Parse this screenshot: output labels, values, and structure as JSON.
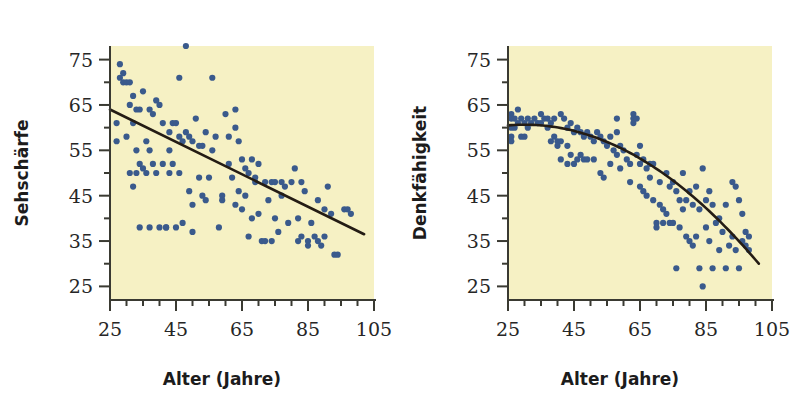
{
  "figure": {
    "background_color": "#ffffff",
    "plot_background_color": "#f6f1c4",
    "point_color": "#3a5a8c",
    "line_color": "#241c14",
    "axis_color": "#3a3a32",
    "text_color": "#262626"
  },
  "panels": [
    {
      "name": "sehschaerfe",
      "ylabel": "Sehschärfe",
      "xlabel": "Alter (Jahre)",
      "xticks": [
        "25",
        "45",
        "65",
        "85",
        "105"
      ],
      "yticks": [
        "75",
        "65",
        "55",
        "45",
        "35",
        "25"
      ]
    },
    {
      "name": "denkfaehigkeit",
      "ylabel": "Denkfähigkeit",
      "xlabel": "Alter (Jahre)",
      "xticks": [
        "25",
        "45",
        "65",
        "85",
        "105"
      ],
      "yticks": [
        "75",
        "65",
        "55",
        "45",
        "35",
        "25"
      ]
    }
  ],
  "chart_data": [
    {
      "type": "scatter",
      "title": "",
      "xlabel": "Alter (Jahre)",
      "ylabel": "Sehschärfe",
      "xlim": [
        25,
        105
      ],
      "ylim": [
        22,
        78
      ],
      "xticks": [
        25,
        45,
        65,
        85,
        105
      ],
      "yticks": [
        25,
        35,
        45,
        55,
        65,
        75
      ],
      "xminor_step": 5,
      "yminor_step": 5,
      "grid": false,
      "legend": "none",
      "points": [
        [
          27,
          61
        ],
        [
          27,
          57
        ],
        [
          28,
          74
        ],
        [
          28,
          71
        ],
        [
          29,
          72
        ],
        [
          29,
          70
        ],
        [
          30,
          70
        ],
        [
          30,
          58
        ],
        [
          31,
          70
        ],
        [
          31,
          65
        ],
        [
          31,
          50
        ],
        [
          32,
          67
        ],
        [
          32,
          61
        ],
        [
          32,
          47
        ],
        [
          33,
          64
        ],
        [
          33,
          55
        ],
        [
          33,
          50
        ],
        [
          34,
          64
        ],
        [
          34,
          52
        ],
        [
          34,
          38
        ],
        [
          35,
          68
        ],
        [
          35,
          51
        ],
        [
          36,
          57
        ],
        [
          36,
          50
        ],
        [
          37,
          64
        ],
        [
          37,
          55
        ],
        [
          37,
          38
        ],
        [
          38,
          63
        ],
        [
          38,
          52
        ],
        [
          39,
          66
        ],
        [
          39,
          50
        ],
        [
          40,
          65
        ],
        [
          40,
          38
        ],
        [
          41,
          61
        ],
        [
          41,
          52
        ],
        [
          42,
          38
        ],
        [
          42,
          38
        ],
        [
          43,
          59
        ],
        [
          43,
          55
        ],
        [
          43,
          50
        ],
        [
          44,
          61
        ],
        [
          44,
          52
        ],
        [
          45,
          61
        ],
        [
          45,
          38
        ],
        [
          46,
          71
        ],
        [
          46,
          58
        ],
        [
          46,
          50
        ],
        [
          47,
          57
        ],
        [
          47,
          39
        ],
        [
          48,
          78
        ],
        [
          48,
          59
        ],
        [
          49,
          58
        ],
        [
          49,
          46
        ],
        [
          50,
          57
        ],
        [
          50,
          43
        ],
        [
          50,
          37
        ],
        [
          51,
          62
        ],
        [
          52,
          56
        ],
        [
          52,
          49
        ],
        [
          53,
          56
        ],
        [
          53,
          45
        ],
        [
          54,
          59
        ],
        [
          54,
          44
        ],
        [
          55,
          49
        ],
        [
          56,
          71
        ],
        [
          56,
          55
        ],
        [
          57,
          58
        ],
        [
          58,
          38
        ],
        [
          59,
          45
        ],
        [
          59,
          44
        ],
        [
          60,
          63
        ],
        [
          61,
          58
        ],
        [
          61,
          52
        ],
        [
          62,
          49
        ],
        [
          63,
          64
        ],
        [
          63,
          60
        ],
        [
          63,
          43
        ],
        [
          64,
          57
        ],
        [
          64,
          46
        ],
        [
          65,
          53
        ],
        [
          65,
          42
        ],
        [
          66,
          51
        ],
        [
          66,
          45
        ],
        [
          67,
          50
        ],
        [
          67,
          36
        ],
        [
          68,
          53
        ],
        [
          68,
          40
        ],
        [
          69,
          49
        ],
        [
          69,
          48
        ],
        [
          70,
          52
        ],
        [
          70,
          41
        ],
        [
          71,
          35
        ],
        [
          72,
          35
        ],
        [
          72,
          48
        ],
        [
          73,
          44
        ],
        [
          74,
          35
        ],
        [
          74,
          48
        ],
        [
          75,
          48
        ],
        [
          75,
          40
        ],
        [
          76,
          37
        ],
        [
          77,
          48
        ],
        [
          77,
          45
        ],
        [
          78,
          47
        ],
        [
          79,
          39
        ],
        [
          80,
          48
        ],
        [
          81,
          51
        ],
        [
          82,
          40
        ],
        [
          82,
          35
        ],
        [
          83,
          36
        ],
        [
          83,
          48
        ],
        [
          84,
          46
        ],
        [
          85,
          35
        ],
        [
          85,
          34
        ],
        [
          86,
          39
        ],
        [
          87,
          36
        ],
        [
          88,
          44
        ],
        [
          88,
          35
        ],
        [
          89,
          34
        ],
        [
          90,
          42
        ],
        [
          90,
          36
        ],
        [
          91,
          47
        ],
        [
          92,
          41
        ],
        [
          93,
          32
        ],
        [
          94,
          32
        ],
        [
          96,
          42
        ],
        [
          97,
          42
        ],
        [
          98,
          41
        ]
      ],
      "fit": {
        "kind": "linear",
        "x_start": 25,
        "x_end": 102,
        "y_start": 64,
        "y_end": 36.5,
        "description": "negative linear trend line from about (25, 64) to (102, 36.5)"
      }
    },
    {
      "type": "scatter",
      "title": "",
      "xlabel": "Alter (Jahre)",
      "ylabel": "Denkfähigkeit",
      "xlim": [
        25,
        105
      ],
      "ylim": [
        22,
        78
      ],
      "xticks": [
        25,
        45,
        65,
        85,
        105
      ],
      "yticks": [
        25,
        35,
        45,
        55,
        65,
        75
      ],
      "xminor_step": 5,
      "yminor_step": 5,
      "grid": false,
      "legend": "none",
      "points": [
        [
          26,
          63
        ],
        [
          26,
          62
        ],
        [
          26,
          60
        ],
        [
          26,
          58
        ],
        [
          26,
          57
        ],
        [
          27,
          62
        ],
        [
          27,
          60
        ],
        [
          28,
          64
        ],
        [
          28,
          61
        ],
        [
          29,
          62
        ],
        [
          29,
          58
        ],
        [
          30,
          61
        ],
        [
          30,
          58
        ],
        [
          31,
          62
        ],
        [
          31,
          60
        ],
        [
          32,
          61
        ],
        [
          33,
          62
        ],
        [
          34,
          61
        ],
        [
          35,
          63
        ],
        [
          35,
          61
        ],
        [
          36,
          62
        ],
        [
          37,
          62
        ],
        [
          37,
          60
        ],
        [
          38,
          61
        ],
        [
          38,
          57
        ],
        [
          39,
          62
        ],
        [
          39,
          58
        ],
        [
          40,
          57
        ],
        [
          40,
          56
        ],
        [
          41,
          63
        ],
        [
          41,
          57
        ],
        [
          41,
          53
        ],
        [
          42,
          62
        ],
        [
          43,
          60
        ],
        [
          43,
          56
        ],
        [
          43,
          52
        ],
        [
          44,
          61
        ],
        [
          44,
          54
        ],
        [
          45,
          59
        ],
        [
          45,
          52
        ],
        [
          46,
          60
        ],
        [
          46,
          53
        ],
        [
          47,
          59
        ],
        [
          47,
          54
        ],
        [
          48,
          58
        ],
        [
          48,
          53
        ],
        [
          49,
          59
        ],
        [
          49,
          53
        ],
        [
          50,
          58
        ],
        [
          51,
          57
        ],
        [
          51,
          53
        ],
        [
          52,
          59
        ],
        [
          53,
          58
        ],
        [
          53,
          50
        ],
        [
          54,
          57
        ],
        [
          54,
          49
        ],
        [
          55,
          56
        ],
        [
          56,
          58
        ],
        [
          56,
          52
        ],
        [
          57,
          55
        ],
        [
          58,
          62
        ],
        [
          58,
          59
        ],
        [
          58,
          54
        ],
        [
          59,
          56
        ],
        [
          59,
          51
        ],
        [
          60,
          55
        ],
        [
          61,
          53
        ],
        [
          62,
          52
        ],
        [
          62,
          48
        ],
        [
          63,
          63
        ],
        [
          63,
          62
        ],
        [
          63,
          61
        ],
        [
          64,
          62
        ],
        [
          64,
          54
        ],
        [
          65,
          56
        ],
        [
          65,
          52
        ],
        [
          65,
          47
        ],
        [
          66,
          53
        ],
        [
          66,
          46
        ],
        [
          67,
          51
        ],
        [
          67,
          45
        ],
        [
          68,
          52
        ],
        [
          68,
          49
        ],
        [
          69,
          52
        ],
        [
          69,
          44
        ],
        [
          70,
          39
        ],
        [
          70,
          38
        ],
        [
          71,
          48
        ],
        [
          71,
          43
        ],
        [
          72,
          42
        ],
        [
          72,
          39
        ],
        [
          73,
          50
        ],
        [
          73,
          41
        ],
        [
          74,
          47
        ],
        [
          74,
          39
        ],
        [
          75,
          48
        ],
        [
          75,
          39
        ],
        [
          76,
          46
        ],
        [
          76,
          29
        ],
        [
          77,
          44
        ],
        [
          77,
          38
        ],
        [
          78,
          50
        ],
        [
          78,
          42
        ],
        [
          79,
          44
        ],
        [
          79,
          36
        ],
        [
          80,
          46
        ],
        [
          80,
          35
        ],
        [
          81,
          43
        ],
        [
          81,
          34
        ],
        [
          82,
          47
        ],
        [
          82,
          36
        ],
        [
          83,
          42
        ],
        [
          83,
          29
        ],
        [
          84,
          51
        ],
        [
          84,
          25
        ],
        [
          85,
          44
        ],
        [
          85,
          38
        ],
        [
          86,
          46
        ],
        [
          86,
          35
        ],
        [
          87,
          43
        ],
        [
          87,
          29
        ],
        [
          88,
          39
        ],
        [
          89,
          40
        ],
        [
          89,
          33
        ],
        [
          90,
          37
        ],
        [
          91,
          43
        ],
        [
          91,
          29
        ],
        [
          92,
          34
        ],
        [
          93,
          48
        ],
        [
          93,
          36
        ],
        [
          94,
          47
        ],
        [
          94,
          33
        ],
        [
          95,
          44
        ],
        [
          95,
          29
        ],
        [
          96,
          41
        ],
        [
          96,
          35
        ],
        [
          97,
          37
        ],
        [
          97,
          34
        ],
        [
          98,
          36
        ],
        [
          98,
          33
        ]
      ],
      "fit": {
        "kind": "quadratic",
        "x_start": 25,
        "x_end": 101,
        "y_start": 60.5,
        "y_end": 30,
        "vertex_x": 30,
        "description": "downward-bending quadratic from about (25, 60.5) flattening near x=30 then falling to (101, 30)"
      }
    }
  ]
}
